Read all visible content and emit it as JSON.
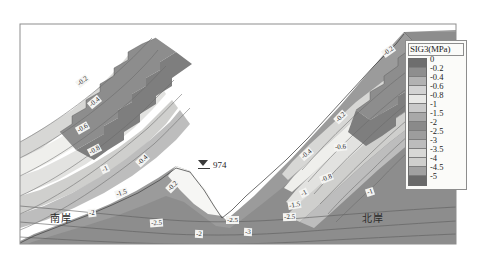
{
  "figure": {
    "kind": "contour-plot",
    "background_color": "#ffffff",
    "border_color": "#8d8d8d"
  },
  "legend": {
    "title": "SIG3(MPa)",
    "position": "right",
    "levels": [
      "0",
      "-0.2",
      "-0.4",
      "-0.6",
      "-0.8",
      "-1",
      "-1.5",
      "-2",
      "-2.5",
      "-3",
      "-3.5",
      "-4",
      "-4.5",
      "-5"
    ],
    "swatch_colors": [
      "#6e6e6e",
      "#8e8e8e",
      "#b2b2b2",
      "#d3d3d3",
      "#e8e8e6",
      "#c9c9c9",
      "#a8a8a8",
      "#8a8a8a",
      "#9d9d9d",
      "#bcbcbc",
      "#d8d8d6",
      "#cfcfcd",
      "#a1a1a1",
      "#6a6a6a"
    ]
  },
  "annotations": {
    "water_level": {
      "symbol": "water-level-triangle",
      "value": "974"
    },
    "banks": [
      {
        "name": "south-bank",
        "label": "南岸",
        "x": 50,
        "y": 212
      },
      {
        "name": "north-bank",
        "label": "北岸",
        "x": 362,
        "y": 212
      }
    ],
    "contour_labels": [
      {
        "text": "-0.2",
        "x": 76,
        "y": 77,
        "rot": -38
      },
      {
        "text": "-0.4",
        "x": 88,
        "y": 98,
        "rot": -40
      },
      {
        "text": "-0.6",
        "x": 76,
        "y": 124,
        "rot": -30
      },
      {
        "text": "-0.8",
        "x": 88,
        "y": 146,
        "rot": -28
      },
      {
        "text": "-1",
        "x": 101,
        "y": 165,
        "rot": -24
      },
      {
        "text": "-1.5",
        "x": 115,
        "y": 189,
        "rot": -18
      },
      {
        "text": "-0.4",
        "x": 136,
        "y": 156,
        "rot": -44
      },
      {
        "text": "-0.2",
        "x": 166,
        "y": 182,
        "rot": -46
      },
      {
        "text": "-2",
        "x": 88,
        "y": 209,
        "rot": -8
      },
      {
        "text": "-2.5",
        "x": 150,
        "y": 219,
        "rot": -4
      },
      {
        "text": "-2.5",
        "x": 226,
        "y": 216,
        "rot": 0
      },
      {
        "text": "-3",
        "x": 244,
        "y": 228,
        "rot": 2
      },
      {
        "text": "-2",
        "x": 195,
        "y": 230,
        "rot": 2
      },
      {
        "text": "-0.2",
        "x": 382,
        "y": 47,
        "rot": -36
      },
      {
        "text": "-0.2",
        "x": 334,
        "y": 113,
        "rot": -46
      },
      {
        "text": "-0.4",
        "x": 300,
        "y": 150,
        "rot": -40
      },
      {
        "text": "-0.6",
        "x": 334,
        "y": 143,
        "rot": -6
      },
      {
        "text": "-0.8",
        "x": 320,
        "y": 174,
        "rot": -22
      },
      {
        "text": "-1",
        "x": 300,
        "y": 189,
        "rot": -26
      },
      {
        "text": "-1.5",
        "x": 288,
        "y": 201,
        "rot": -10
      },
      {
        "text": "-1",
        "x": 366,
        "y": 188,
        "rot": -18
      },
      {
        "text": "-2.5",
        "x": 283,
        "y": 213,
        "rot": -2
      }
    ]
  }
}
